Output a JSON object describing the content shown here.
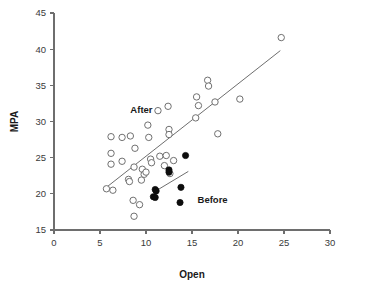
{
  "chart_data": {
    "type": "scatter",
    "title": "",
    "xlabel": "Open",
    "ylabel": "MPA",
    "xlim": [
      0,
      30
    ],
    "ylim": [
      15,
      45
    ],
    "xticks": [
      0,
      5,
      10,
      15,
      20,
      25,
      30
    ],
    "yticks": [
      15,
      20,
      25,
      30,
      35,
      40,
      45
    ],
    "grid": false,
    "legend_position": "in-plot annotations",
    "annotations": [
      {
        "text": "After",
        "x": 8.3,
        "y": 31.2
      },
      {
        "text": "Before",
        "x": 15.6,
        "y": 18.8
      }
    ],
    "series": [
      {
        "name": "After",
        "marker": "open-circle",
        "color": "#707070",
        "points": [
          {
            "x": 5.7,
            "y": 20.7
          },
          {
            "x": 6.2,
            "y": 24.1
          },
          {
            "x": 6.2,
            "y": 25.6
          },
          {
            "x": 6.2,
            "y": 27.9
          },
          {
            "x": 6.4,
            "y": 20.5
          },
          {
            "x": 7.4,
            "y": 24.5
          },
          {
            "x": 7.4,
            "y": 27.8
          },
          {
            "x": 8.1,
            "y": 22.0
          },
          {
            "x": 8.2,
            "y": 21.7
          },
          {
            "x": 8.3,
            "y": 28.0
          },
          {
            "x": 8.6,
            "y": 19.1
          },
          {
            "x": 8.7,
            "y": 23.7
          },
          {
            "x": 8.8,
            "y": 26.3
          },
          {
            "x": 8.7,
            "y": 16.9
          },
          {
            "x": 9.3,
            "y": 18.5
          },
          {
            "x": 9.5,
            "y": 21.9
          },
          {
            "x": 9.6,
            "y": 23.4
          },
          {
            "x": 9.8,
            "y": 22.7
          },
          {
            "x": 10.0,
            "y": 23.0
          },
          {
            "x": 10.2,
            "y": 29.5
          },
          {
            "x": 10.3,
            "y": 27.8
          },
          {
            "x": 10.5,
            "y": 24.8
          },
          {
            "x": 10.6,
            "y": 24.3
          },
          {
            "x": 11.3,
            "y": 31.5
          },
          {
            "x": 11.5,
            "y": 25.2
          },
          {
            "x": 12.0,
            "y": 23.9
          },
          {
            "x": 12.2,
            "y": 25.3
          },
          {
            "x": 12.4,
            "y": 32.1
          },
          {
            "x": 12.5,
            "y": 28.9
          },
          {
            "x": 12.5,
            "y": 28.2
          },
          {
            "x": 12.6,
            "y": 22.8
          },
          {
            "x": 13.0,
            "y": 24.6
          },
          {
            "x": 15.4,
            "y": 30.5
          },
          {
            "x": 15.5,
            "y": 33.4
          },
          {
            "x": 15.7,
            "y": 32.2
          },
          {
            "x": 16.7,
            "y": 35.7
          },
          {
            "x": 16.8,
            "y": 34.9
          },
          {
            "x": 17.5,
            "y": 32.7
          },
          {
            "x": 17.8,
            "y": 28.3
          },
          {
            "x": 20.2,
            "y": 33.1
          },
          {
            "x": 24.7,
            "y": 41.6
          }
        ]
      },
      {
        "name": "Before",
        "marker": "filled-circle",
        "color": "#0d0d0d",
        "points": [
          {
            "x": 10.8,
            "y": 19.6
          },
          {
            "x": 11.0,
            "y": 19.5
          },
          {
            "x": 11.0,
            "y": 20.6
          },
          {
            "x": 11.1,
            "y": 20.4
          },
          {
            "x": 12.5,
            "y": 23.3
          },
          {
            "x": 12.5,
            "y": 23.0
          },
          {
            "x": 13.7,
            "y": 18.8
          },
          {
            "x": 13.8,
            "y": 20.9
          },
          {
            "x": 14.3,
            "y": 25.3
          }
        ]
      }
    ],
    "fit_lines": [
      {
        "name": "After-fit",
        "x0": 5.6,
        "y0": 20.8,
        "x1": 24.6,
        "y1": 39.8
      },
      {
        "name": "Before-fit",
        "x0": 11.2,
        "y0": 20.5,
        "x1": 14.6,
        "y1": 23.1
      }
    ]
  }
}
